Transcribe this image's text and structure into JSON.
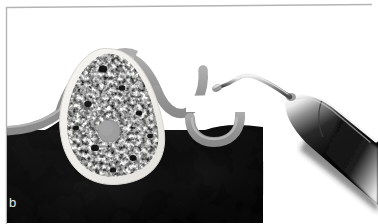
{
  "figure": {
    "panel_label": "b",
    "caption_text": "",
    "width": 378,
    "height": 224,
    "background_color": "#ffffff",
    "border_color": "#b4b4b4"
  },
  "colors": {
    "page_background": "#ffffff",
    "panel_border": "#b4b4b4",
    "submucosa_dark": "#0a0a0a",
    "submucosa_dark_mid": "#141414",
    "gingiva_band": "#9a9a9a",
    "gingiva_band_light": "#b0b0b0",
    "cortical_bone": "#f0efeb",
    "cortical_bone_edge": "#d8d7d2",
    "trabecular_light": "#f7f7f5",
    "trabecular_dark": "#1c1c1c",
    "trabecular_mid": "#7a7a7a",
    "vessel_circle": "#9e9e9e",
    "vessel_circle_edge": "#8a8a8a",
    "instrument_handle_dark": "#050505",
    "instrument_handle_mid": "#4a4a4a",
    "instrument_highlight": "#ffffff",
    "instrument_shank_metal": "#8f8f8f",
    "instrument_tip_metal": "#c9c9c9"
  },
  "anatomy": {
    "structures": [
      {
        "name": "gingival-tissue-band",
        "label": "Gingiva / mucosa band",
        "description": "Gray curved band outlining the alveolar ridge and adjacent tooth socket"
      },
      {
        "name": "cortical-bone-shell",
        "label": "Cortical bone shell",
        "description": "Pale outer shell of the alveolar ridge cross-section"
      },
      {
        "name": "trabecular-bone",
        "label": "Trabecular bone",
        "description": "Mottled black and white speckled cancellous bone fill"
      },
      {
        "name": "vascular-canal",
        "label": "Vascular canal",
        "description": "Solid gray circle inside the trabecular bone"
      },
      {
        "name": "submucosal-dark-field",
        "label": "Submucosal dark field",
        "description": "Near-black region filling the lower half of the panel"
      },
      {
        "name": "adjacent-socket-crest",
        "label": "Adjacent socket crest",
        "description": "Hook-shaped gray band at the right of the ridge"
      }
    ]
  },
  "instrument": {
    "name": "dental-probe",
    "label": "Dental probe / periodontal instrument",
    "parts": [
      {
        "name": "instrument-handle",
        "label": "Tapered handle"
      },
      {
        "name": "instrument-collar",
        "label": "Handle collar ring"
      },
      {
        "name": "instrument-shank",
        "label": "Angled shank"
      },
      {
        "name": "instrument-tip",
        "label": "Working tip"
      }
    ],
    "orientation": "entering from upper right, tip pointing down-left toward the ridge"
  }
}
